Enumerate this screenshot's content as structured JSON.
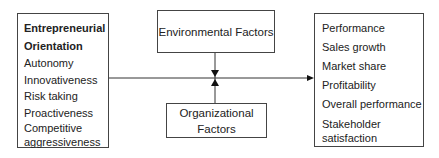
{
  "diagram": {
    "left_box": {
      "title_line1": "Entrepreneurial",
      "title_line2": "Orientation",
      "items": [
        "Autonomy",
        "Innovativeness",
        "Risk taking",
        "Proactiveness",
        "Competitive",
        "aggressiveness"
      ]
    },
    "top_box": {
      "label": "Environmental Factors"
    },
    "bottom_box": {
      "line1": "Organizational",
      "line2": "Factors"
    },
    "right_box": {
      "items": [
        "Performance",
        "Sales growth",
        "Market share",
        "Profitability",
        "Overall performance",
        "Stakeholder",
        "satisfaction"
      ]
    },
    "colors": {
      "line": "#333333",
      "border": "#444444",
      "text": "#222222"
    }
  }
}
